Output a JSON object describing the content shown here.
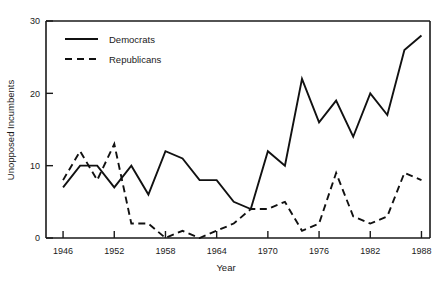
{
  "chart_data": {
    "type": "line",
    "title": "",
    "xlabel": "Year",
    "ylabel": "Unopposed Incumbents",
    "xlim": [
      1944,
      1989
    ],
    "ylim": [
      0,
      30
    ],
    "xticks": [
      1946,
      1952,
      1958,
      1964,
      1970,
      1976,
      1982,
      1988
    ],
    "xtick_labels": [
      "1946",
      "1952",
      "1958",
      "1964",
      "1970",
      "1976",
      "1982",
      "1988"
    ],
    "yticks": [
      0,
      10,
      20,
      30
    ],
    "ytick_labels": [
      "0",
      "10",
      "20",
      "30"
    ],
    "grid": false,
    "legend_position": "upper left",
    "x": [
      1946,
      1948,
      1950,
      1952,
      1954,
      1956,
      1958,
      1960,
      1962,
      1964,
      1966,
      1968,
      1970,
      1972,
      1974,
      1976,
      1978,
      1980,
      1982,
      1984,
      1986,
      1988
    ],
    "series": [
      {
        "name": "Democrats",
        "style": "solid",
        "color": "#111111",
        "values": [
          7,
          10,
          10,
          7,
          10,
          6,
          12,
          11,
          8,
          8,
          5,
          4,
          12,
          10,
          22,
          16,
          19,
          14,
          20,
          17,
          26,
          28
        ]
      },
      {
        "name": "Republicans",
        "style": "dashed",
        "color": "#111111",
        "values": [
          8,
          12,
          8,
          13,
          2,
          2,
          0,
          1,
          0,
          1,
          2,
          4,
          4,
          5,
          1,
          2,
          9,
          3,
          2,
          3,
          9,
          8
        ]
      }
    ],
    "annotations": []
  },
  "legend": {
    "items": [
      {
        "label": "Democrats",
        "style": "solid"
      },
      {
        "label": "Republicans",
        "style": "dashed"
      }
    ]
  }
}
